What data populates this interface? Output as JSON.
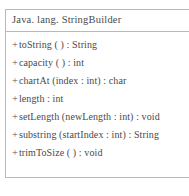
{
  "diagram": {
    "type": "uml-class-diagram",
    "class_box": {
      "name": "Java. lang. StringBuilder",
      "visibility_symbol": "+",
      "members": [
        {
          "visibility": "+",
          "signature": "toString ( ) : String"
        },
        {
          "visibility": "+",
          "signature": "capacity ( ) : int"
        },
        {
          "visibility": "+",
          "signature": "chartAt (index : int) : char"
        },
        {
          "visibility": "+",
          "signature": "length : int"
        },
        {
          "visibility": "+",
          "signature": "setLength (newLength : int) : void"
        },
        {
          "visibility": "+",
          "signature": "substring (startIndex : int) : String"
        },
        {
          "visibility": "+",
          "signature": "trimToSize ( ) : void"
        }
      ]
    },
    "colors": {
      "border": "#b9b9b9",
      "text": "#4a4a4a",
      "background": "#ffffff"
    }
  }
}
